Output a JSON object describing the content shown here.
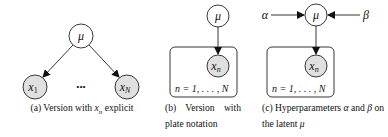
{
  "colors": {
    "observed_fill": "#e0e0e0",
    "latent_fill": "#ffffff",
    "stroke": "#222222"
  },
  "panels": [
    {
      "id": "a",
      "nodes": {
        "mu": "μ",
        "x1": "x",
        "x1_sub": "1",
        "xN": "x",
        "xN_sub": "N",
        "ellipsis": "•••"
      },
      "caption": {
        "prefix": "(a) Version with ",
        "var": "x",
        "var_sub": "n",
        "suffix": " explicit"
      }
    },
    {
      "id": "b",
      "nodes": {
        "mu": "μ",
        "xn": "x",
        "xn_sub": "n"
      },
      "plate_label": "n = 1, . . . , N",
      "caption": {
        "line1": "(b) Version with",
        "line2": "plate notation"
      }
    },
    {
      "id": "c",
      "nodes": {
        "alpha": "α",
        "mu": "μ",
        "beta": "β",
        "xn": "x",
        "xn_sub": "n"
      },
      "plate_label": "n = 1, . . . , N",
      "caption": {
        "prefix": "(c) Hyperparameters ",
        "alpha": "α",
        "mid": " and ",
        "beta": "β",
        "suffix": " on the latent ",
        "mu": "μ"
      }
    }
  ]
}
